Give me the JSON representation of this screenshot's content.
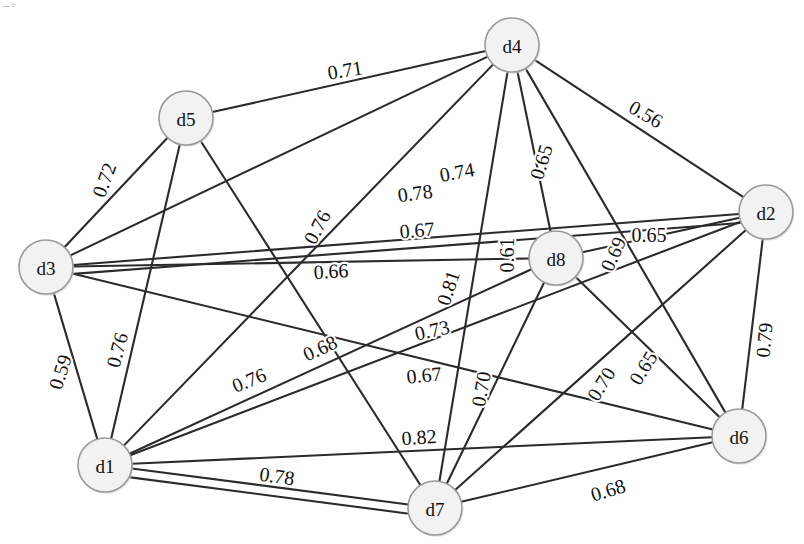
{
  "figure": {
    "type": "weighted-undirected-graph",
    "title": "",
    "background_color": "#ffffff",
    "edge_color": "#2b2b2b",
    "node_fill_color": "#f2f2f2",
    "node_stroke_color": "#9a9a9a",
    "corner_artifact_text": "–◦"
  },
  "nodes": [
    {
      "id": "d1",
      "label": "d1",
      "x": 105,
      "y": 465,
      "r": 27
    },
    {
      "id": "d2",
      "label": "d2",
      "x": 766,
      "y": 212,
      "r": 27
    },
    {
      "id": "d3",
      "label": "d3",
      "x": 46,
      "y": 267,
      "r": 27
    },
    {
      "id": "d4",
      "label": "d4",
      "x": 512,
      "y": 45,
      "r": 27
    },
    {
      "id": "d5",
      "label": "d5",
      "x": 186,
      "y": 118,
      "r": 27
    },
    {
      "id": "d6",
      "label": "d6",
      "x": 739,
      "y": 436,
      "r": 27
    },
    {
      "id": "d7",
      "label": "d7",
      "x": 435,
      "y": 508,
      "r": 27
    },
    {
      "id": "d8",
      "label": "d8",
      "x": 556,
      "y": 258,
      "r": 27
    }
  ],
  "edges": [
    {
      "source": "d5",
      "target": "d4",
      "weight": "0.71",
      "lx": 345,
      "ly": 70,
      "rot": -9
    },
    {
      "source": "d4",
      "target": "d2",
      "weight": "0.56",
      "lx": 646,
      "ly": 114,
      "rot": 30
    },
    {
      "source": "d3",
      "target": "d5",
      "weight": "0.72",
      "lx": 104,
      "ly": 180,
      "rot": -70
    },
    {
      "source": "d3",
      "target": "d4",
      "weight": "0.74",
      "lx": 457,
      "ly": 172,
      "rot": -10
    },
    {
      "source": "d4",
      "target": "d8",
      "weight": "0.65",
      "lx": 541,
      "ly": 162,
      "rot": -73
    },
    {
      "source": "d3",
      "target": "d2",
      "weight": "0.78",
      "lx": 415,
      "ly": 193,
      "rot": -8
    },
    {
      "source": "d5",
      "target": "d7",
      "weight": "0.76",
      "lx": 317,
      "ly": 227,
      "rot": -62
    },
    {
      "source": "d3",
      "target": "d2",
      "weight": "0.67",
      "lx": 417,
      "ly": 230,
      "rot": -5
    },
    {
      "source": "d8",
      "target": "d2",
      "weight": "0.65",
      "lx": 649,
      "ly": 235,
      "rot": 0
    },
    {
      "source": "d4",
      "target": "d6",
      "weight": "0.69",
      "lx": 613,
      "ly": 254,
      "rot": -66
    },
    {
      "source": "d3",
      "target": "d8",
      "weight": "0.66",
      "lx": 331,
      "ly": 271,
      "rot": -3
    },
    {
      "source": "d7",
      "target": "d8",
      "weight": "0.61",
      "lx": 507,
      "ly": 255,
      "rot": -90
    },
    {
      "source": "d1",
      "target": "d2",
      "weight": "0.81",
      "lx": 448,
      "ly": 288,
      "rot": -72
    },
    {
      "source": "d3",
      "target": "d1",
      "weight": "0.59",
      "lx": 60,
      "ly": 372,
      "rot": -73
    },
    {
      "source": "d5",
      "target": "d1",
      "weight": "0.76",
      "lx": 117,
      "ly": 350,
      "rot": -75
    },
    {
      "source": "d1",
      "target": "d8",
      "weight": "0.73",
      "lx": 432,
      "ly": 330,
      "rot": -13
    },
    {
      "source": "d2",
      "target": "d6",
      "weight": "0.79",
      "lx": 764,
      "ly": 340,
      "rot": -85
    },
    {
      "source": "d1",
      "target": "d6",
      "weight": "0.68",
      "lx": 320,
      "ly": 348,
      "rot": -25
    },
    {
      "source": "d1",
      "target": "d4",
      "weight": "0.76",
      "lx": 249,
      "ly": 380,
      "rot": -22
    },
    {
      "source": "d3",
      "target": "d6",
      "weight": "0.67",
      "lx": 424,
      "ly": 375,
      "rot": -6
    },
    {
      "source": "d7",
      "target": "d2",
      "weight": "0.65",
      "lx": 643,
      "ly": 368,
      "rot": -58
    },
    {
      "source": "d8",
      "target": "d6",
      "weight": "0.70",
      "lx": 601,
      "ly": 384,
      "rot": -58
    },
    {
      "source": "d7",
      "target": "d4",
      "weight": "0.70",
      "lx": 481,
      "ly": 389,
      "rot": -80
    },
    {
      "source": "d1",
      "target": "d7",
      "weight": "0.82",
      "lx": 419,
      "ly": 437,
      "rot": -4
    },
    {
      "source": "d1",
      "target": "d7",
      "weight": "0.78",
      "lx": 277,
      "ly": 476,
      "rot": 8
    },
    {
      "source": "d7",
      "target": "d6",
      "weight": "0.68",
      "lx": 608,
      "ly": 490,
      "rot": -17
    }
  ],
  "chart_data": {
    "type": "graph",
    "title": "",
    "xlabel": "",
    "ylabel": "",
    "node_labels": [
      "d1",
      "d2",
      "d3",
      "d4",
      "d5",
      "d6",
      "d7",
      "d8"
    ],
    "edge_weights": [
      [
        "d5",
        "d4",
        0.71
      ],
      [
        "d4",
        "d2",
        0.56
      ],
      [
        "d3",
        "d5",
        0.72
      ],
      [
        "d3",
        "d4",
        0.74
      ],
      [
        "d4",
        "d8",
        0.65
      ],
      [
        "d3",
        "d2",
        0.78
      ],
      [
        "d5",
        "d7",
        0.76
      ],
      [
        "d3",
        "d2",
        0.67
      ],
      [
        "d8",
        "d2",
        0.65
      ],
      [
        "d4",
        "d6",
        0.69
      ],
      [
        "d3",
        "d8",
        0.66
      ],
      [
        "d7",
        "d8",
        0.61
      ],
      [
        "d1",
        "d2",
        0.81
      ],
      [
        "d3",
        "d1",
        0.59
      ],
      [
        "d5",
        "d1",
        0.76
      ],
      [
        "d1",
        "d8",
        0.73
      ],
      [
        "d2",
        "d6",
        0.79
      ],
      [
        "d1",
        "d6",
        0.68
      ],
      [
        "d1",
        "d4",
        0.76
      ],
      [
        "d3",
        "d6",
        0.67
      ],
      [
        "d7",
        "d2",
        0.65
      ],
      [
        "d8",
        "d6",
        0.7
      ],
      [
        "d7",
        "d4",
        0.7
      ],
      [
        "d1",
        "d7",
        0.82
      ],
      [
        "d1",
        "d7",
        0.78
      ],
      [
        "d7",
        "d6",
        0.68
      ]
    ],
    "weight_range": [
      0.56,
      0.82
    ],
    "legend": [],
    "grid": false
  }
}
